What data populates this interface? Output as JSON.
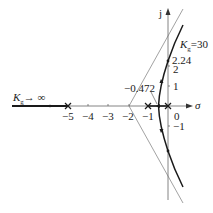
{
  "diagram": {
    "type": "root-locus",
    "axes": {
      "real_axis_label": "σ",
      "imag_axis_label": "j",
      "real_ticks": [
        {
          "value": -5,
          "label": "−5"
        },
        {
          "value": -4,
          "label": "−4"
        },
        {
          "value": -3,
          "label": "−3"
        },
        {
          "value": -2,
          "label": "−2"
        },
        {
          "value": -1,
          "label": "−1"
        },
        {
          "value": 0,
          "label": "0"
        }
      ],
      "imag_ticks": [
        {
          "value": 2,
          "label": "2"
        },
        {
          "value": 1,
          "label": "1"
        },
        {
          "value": -1,
          "label": "−1"
        }
      ]
    },
    "poles": [
      -5,
      -1,
      0
    ],
    "asymptote_centroid": -2,
    "breakaway_point": {
      "value": -0.472,
      "label": "−0.472"
    },
    "imag_crossing": {
      "value": 2.24,
      "label": "2.24",
      "gain_label_K": "K",
      "gain_label_sub": "g",
      "gain_label_value": "=30"
    },
    "infinity_label": {
      "K": "K",
      "sub": "g",
      "arrow": "→ ∞"
    },
    "colors": {
      "locus": "#1a1a1a",
      "axis": "#555555",
      "asymptote": "#777777"
    }
  }
}
